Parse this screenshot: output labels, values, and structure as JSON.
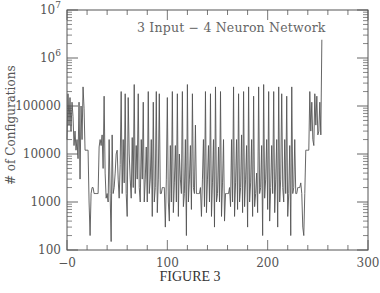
{
  "figure": {
    "caption": "FIGURE 3",
    "annotation": "3 Input − 4 Neuron Network",
    "ylabel": "# of Configurations",
    "xticks": [
      "−0",
      "100",
      "200",
      "300"
    ],
    "yticks": [
      "100",
      "1000",
      "10000",
      "100000",
      "10⁶",
      "10⁷"
    ]
  },
  "colors": {
    "line": "#555555",
    "axis": "#555555"
  },
  "chart_data": {
    "type": "line",
    "xlabel": "",
    "ylabel": "# of Configurations",
    "xlim": [
      0,
      300
    ],
    "ylim": [
      100,
      10000000
    ],
    "yscale": "log",
    "grid": false,
    "legend": null,
    "caption": "FIGURE 3",
    "x_ticks": [
      0,
      100,
      200,
      300
    ],
    "y_ticks": [
      100,
      1000,
      10000,
      100000,
      1000000,
      10000000
    ],
    "x": [
      0,
      1,
      2,
      3,
      4,
      5,
      6,
      7,
      8,
      9,
      10,
      11,
      12,
      13,
      14,
      15,
      16,
      17,
      18,
      19,
      20,
      21,
      22,
      23,
      24,
      25,
      26,
      27,
      28,
      29,
      30,
      31,
      32,
      33,
      34,
      35,
      36,
      37,
      38,
      39,
      40,
      41,
      42,
      43,
      44,
      45,
      46,
      47,
      48,
      49,
      50,
      51,
      52,
      53,
      54,
      55,
      56,
      57,
      58,
      59,
      60,
      61,
      62,
      63,
      64,
      65,
      66,
      67,
      68,
      69,
      70,
      71,
      72,
      73,
      74,
      75,
      76,
      77,
      78,
      79,
      80,
      81,
      82,
      83,
      84,
      85,
      86,
      87,
      88,
      89,
      90,
      91,
      92,
      93,
      94,
      95,
      96,
      97,
      98,
      99,
      100,
      101,
      102,
      103,
      104,
      105,
      106,
      107,
      108,
      109,
      110,
      111,
      112,
      113,
      114,
      115,
      116,
      117,
      118,
      119,
      120,
      121,
      122,
      123,
      124,
      125,
      126,
      127,
      128,
      129,
      130,
      131,
      132,
      133,
      134,
      135,
      136,
      137,
      138,
      139,
      140,
      141,
      142,
      143,
      144,
      145,
      146,
      147,
      148,
      149,
      150,
      151,
      152,
      153,
      154,
      155,
      156,
      157,
      158,
      159,
      160,
      161,
      162,
      163,
      164,
      165,
      166,
      167,
      168,
      169,
      170,
      171,
      172,
      173,
      174,
      175,
      176,
      177,
      178,
      179,
      180,
      181,
      182,
      183,
      184,
      185,
      186,
      187,
      188,
      189,
      190,
      191,
      192,
      193,
      194,
      195,
      196,
      197,
      198,
      199,
      200,
      201,
      202,
      203,
      204,
      205,
      206,
      207,
      208,
      209,
      210,
      211,
      212,
      213,
      214,
      215,
      216,
      217,
      218,
      219,
      220,
      221,
      222,
      223,
      224,
      225,
      226,
      227,
      228,
      229,
      230,
      231,
      232,
      233,
      234,
      235,
      236,
      237,
      238,
      239,
      240,
      241,
      242,
      243,
      244,
      245,
      246,
      247,
      248,
      249,
      250,
      251,
      252,
      253,
      254,
      255,
      256
    ],
    "y": [
      20000,
      180000,
      40000,
      150000,
      30000,
      120000,
      60000,
      15000,
      30000,
      12000,
      20000,
      8000,
      120000,
      3000,
      100000,
      20000,
      250000,
      90000,
      12000,
      12000,
      12000,
      12000,
      1000,
      200,
      1500,
      2000,
      2000,
      1500,
      1500,
      1500,
      1500,
      1500,
      14000,
      20000,
      15000,
      25000,
      5000,
      160000,
      4000,
      1200,
      1500,
      1000,
      20000,
      1500,
      150,
      25000,
      1500,
      2000,
      4000,
      10000,
      12000,
      3000,
      1200,
      6000,
      200000,
      1500,
      20000,
      2500,
      180000,
      1500,
      500,
      150000,
      10000,
      3000,
      1200,
      22000,
      2000,
      280000,
      1500,
      15000,
      3000,
      180000,
      2000,
      1000,
      20000,
      3000,
      120000,
      1000,
      3000,
      14000,
      1000,
      200000,
      1500,
      3000,
      20000,
      500,
      120000,
      1000,
      2000,
      200000,
      600,
      3000,
      180000,
      1500,
      1500,
      2000,
      2000,
      2000,
      300,
      3000,
      150000,
      1000,
      400,
      15000,
      1000,
      200000,
      600,
      2500,
      15000,
      1000,
      180000,
      500,
      10000,
      3000,
      1500,
      200000,
      800,
      1500,
      20000,
      200,
      280000,
      1000,
      3000,
      15000,
      700,
      180000,
      2000,
      1500,
      40000,
      1500,
      1500,
      1500,
      1500,
      2000,
      500,
      3000,
      20000,
      800,
      200000,
      600,
      3000,
      15000,
      1000,
      180000,
      500,
      2500,
      20000,
      300,
      250000,
      1000,
      1500,
      14000,
      1000,
      200000,
      500,
      2500,
      20000,
      400,
      1500,
      1500,
      1500,
      1500,
      2000,
      800,
      20000,
      1000,
      250000,
      500,
      2500,
      20000,
      700,
      180000,
      1000,
      2000,
      25000,
      600,
      200000,
      800,
      3000,
      15000,
      300,
      250000,
      1000,
      2500,
      20000,
      500,
      160000,
      800,
      1500,
      4000,
      600,
      250000,
      1500,
      2000,
      15000,
      200,
      280000,
      1200,
      3000,
      20000,
      700,
      200000,
      400,
      2000,
      15000,
      1500,
      200000,
      600,
      3000,
      20000,
      300,
      250000,
      1000,
      3000,
      180000,
      2000,
      1000,
      20000,
      1500,
      160000,
      500,
      1500,
      15000,
      200,
      250000,
      1500,
      2000,
      20000,
      1500,
      1500,
      2000,
      2000,
      2000,
      2500,
      1500,
      300,
      200,
      1500,
      12000,
      12000,
      12000,
      12000,
      200000,
      30000,
      120000,
      20000,
      15000,
      180000,
      40000,
      160000,
      25000,
      30000,
      120000,
      25000,
      2400000
    ]
  }
}
